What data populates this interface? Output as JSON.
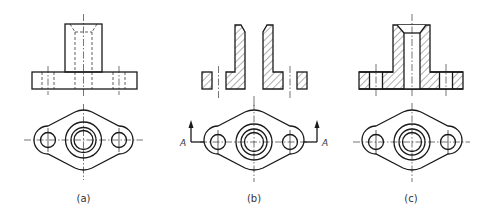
{
  "figure": {
    "views": [
      {
        "id": "a",
        "caption": "(a)",
        "description": "Front view (hidden lines) and top view of flanged bushing"
      },
      {
        "id": "b",
        "caption": "(b)",
        "description": "Section A-A cut pieces and top view with cutting plane"
      },
      {
        "id": "c",
        "caption": "(c)",
        "description": "Full section front view and top view"
      }
    ],
    "section_labels": {
      "left": "A",
      "right": "A"
    },
    "colors": {
      "line": "#1a1a1a",
      "background": "#ffffff",
      "caption": "#333333"
    }
  }
}
